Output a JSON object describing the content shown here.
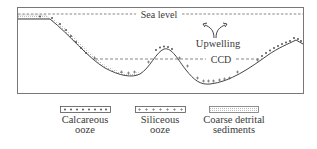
{
  "diagram": {
    "labels": {
      "sea_level": "Sea level",
      "upwelling": "Upwelling",
      "ccd": "CCD"
    },
    "legend": [
      {
        "id": "calcareous",
        "line1": "Calcareous",
        "line2": "ooze",
        "symbol": "dot"
      },
      {
        "id": "siliceous",
        "line1": "Siliceous",
        "line2": "ooze",
        "symbol": "plus"
      },
      {
        "id": "coarse",
        "line1": "Coarse detrital",
        "line2": "sediments",
        "symbol": "stipple"
      }
    ],
    "colors": {
      "line": "#4a4a4a",
      "text": "#3a3a3a",
      "background": "#ffffff"
    }
  }
}
